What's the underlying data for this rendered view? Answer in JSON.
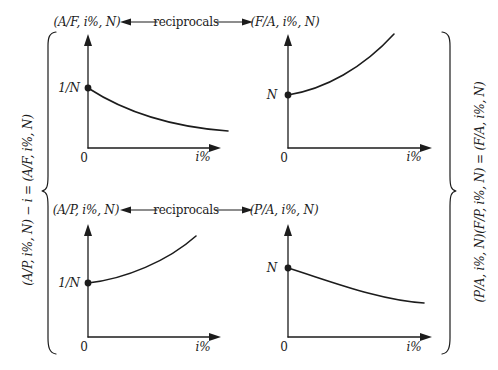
{
  "colors": {
    "background": "#ffffff",
    "ink": "#1c1c1c"
  },
  "relations": {
    "top": {
      "left_factor": "(A/F, i%, N)",
      "label": "reciprocals",
      "right_factor": "(F/A, i%, N)"
    },
    "bottom": {
      "left_factor": "(A/P, i%, N)",
      "label": "reciprocals",
      "right_factor": "(P/A, i%, N)"
    }
  },
  "side_identities": {
    "left": "(A/P, i%, N) − i = (A/F, i%, N)",
    "right": "(P/A, i%, N)(F/P, i%, N) = (F/A, i%, N)"
  },
  "graphs": {
    "top_left": {
      "factor": "(A/F, i%, N)",
      "intercept_label": "1/N",
      "origin_label": "0",
      "x_axis_label": "i%",
      "curve_shape": "decreasing convex, starts at 1/N and flattens as i% grows"
    },
    "top_right": {
      "factor": "(F/A, i%, N)",
      "intercept_label": "N",
      "origin_label": "0",
      "x_axis_label": "i%",
      "curve_shape": "increasing convex, starts at N and rises steeper as i% grows"
    },
    "bottom_left": {
      "factor": "(A/P, i%, N)",
      "intercept_label": "1/N",
      "origin_label": "0",
      "x_axis_label": "i%",
      "curve_shape": "increasing convex, starts at 1/N and rises steeper as i% grows"
    },
    "bottom_right": {
      "factor": "(P/A, i%, N)",
      "intercept_label": "N",
      "origin_label": "0",
      "x_axis_label": "i%",
      "curve_shape": "decreasing, starts at N and flattens as i% grows"
    }
  }
}
